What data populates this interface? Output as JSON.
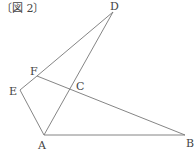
{
  "caption": "〔図 2〕",
  "points": {
    "D": {
      "label": "D",
      "x": 113,
      "y": 12
    },
    "E": {
      "label": "E",
      "x": 20,
      "y": 90
    },
    "F": {
      "label": "F",
      "x": 37,
      "y": 76
    },
    "C": {
      "label": "C",
      "x": 73,
      "y": 91
    },
    "A": {
      "label": "A",
      "x": 44,
      "y": 135
    },
    "B": {
      "label": "B",
      "x": 185,
      "y": 135
    }
  },
  "segments": [
    [
      "F",
      "D"
    ],
    [
      "D",
      "A"
    ],
    [
      "E",
      "F"
    ],
    [
      "E",
      "A"
    ],
    [
      "A",
      "B"
    ],
    [
      "F",
      "B"
    ]
  ]
}
